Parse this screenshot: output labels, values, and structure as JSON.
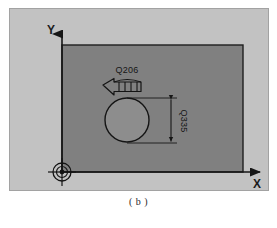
{
  "figure": {
    "caption": "( b )",
    "axes": {
      "y_label": "Y",
      "x_label": "X"
    },
    "annotations": {
      "feed_label": "Q206",
      "depth_label": "Q335"
    },
    "colors": {
      "panel_background": "#c2c2c2",
      "panel_border": "#a2a2a2",
      "workpiece_fill": "#808080",
      "workpiece_edge": "#1e1e1e",
      "pocket_fill": "#909090",
      "line": "#161616",
      "page_background": "#ffffff"
    },
    "geometry": {
      "workpiece": {
        "x": 53,
        "y": 37,
        "width": 181,
        "height": 127
      },
      "pocket_circle": {
        "cx": 118,
        "cy": 112,
        "r": 22
      },
      "origin": {
        "x": 53,
        "y": 164
      },
      "dimension_line": {
        "x": 162,
        "y_top": 90,
        "y_bottom": 135
      }
    }
  }
}
